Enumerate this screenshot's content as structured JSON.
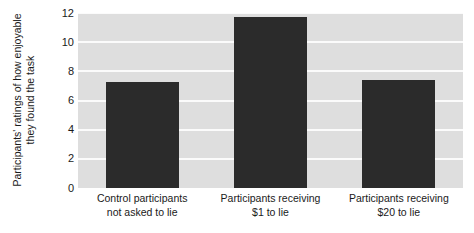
{
  "chart_data": {
    "type": "bar",
    "title": "",
    "xlabel": "",
    "ylabel_line1": "Participants' ratings of how enjoyable",
    "ylabel_line2": "they found the task",
    "ylabel": "Participants' ratings of how enjoyable they found the task",
    "categories": [
      "Control participants not asked to lie",
      "Participants receiving $1 to lie",
      "Participants receiving $20 to lie"
    ],
    "category_lines": [
      {
        "line1": "Control participants",
        "line2": "not asked to lie"
      },
      {
        "line1": "Participants receiving",
        "line2": "$1 to lie"
      },
      {
        "line1": "Participants receiving",
        "line2": "$20 to lie"
      }
    ],
    "values": [
      7.3,
      11.7,
      7.4
    ],
    "ylim": [
      0,
      12
    ],
    "yticks": [
      0,
      2,
      4,
      6,
      8,
      10,
      12
    ],
    "ytick_labels": [
      "0",
      "2",
      "4",
      "6",
      "8",
      "10",
      "12"
    ],
    "grid": true,
    "grid_axis": "y",
    "legend": "none",
    "bar_color": "#2b2b2b",
    "plot_background": "#dedede",
    "gridline_color": "#fbfbfb",
    "figure_background": "#ffffff"
  }
}
